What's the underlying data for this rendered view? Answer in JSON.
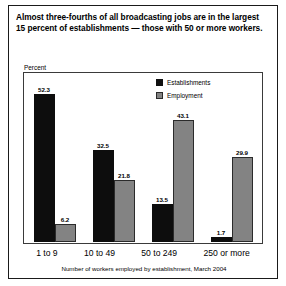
{
  "figure": {
    "title": "Almost three-fourths of all broadcasting jobs are in the largest 15 percent of establishments — those with 50 or more workers.",
    "axis_note": "Percent",
    "footnote": "Number of workers employed by establishment, March 2004"
  },
  "colors": {
    "establishments": "#0d0d0d",
    "employment": "#838383",
    "border": "#1a1a1a",
    "background": "#ffffff"
  },
  "chart_data": {
    "type": "bar",
    "title": "Almost three-fourths of all broadcasting jobs are in the largest 15 percent of establishments — those with 50 or more workers.",
    "xlabel": "Number of workers employed by establishment, March 2004",
    "ylabel": "Percent",
    "ylim": [
      0,
      60
    ],
    "grid": false,
    "legend_position": "top-right",
    "categories": [
      "1 to 9",
      "10 to 49",
      "50 to 249",
      "250 or more"
    ],
    "series": [
      {
        "name": "Establishments",
        "color": "#0d0d0d",
        "values": [
          52.3,
          32.5,
          13.5,
          1.7
        ],
        "labels": [
          "52.3",
          "32.5",
          "13.5",
          "1.7"
        ]
      },
      {
        "name": "Employment",
        "color": "#838383",
        "values": [
          6.2,
          21.8,
          43.1,
          29.9
        ],
        "labels": [
          "6.2",
          "21.8",
          "43.1",
          "29.9"
        ]
      }
    ]
  }
}
